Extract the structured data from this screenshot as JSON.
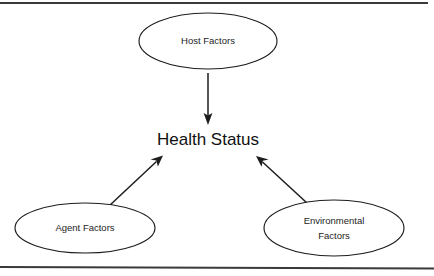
{
  "page": {
    "background_color": "#ffffff",
    "width": 434,
    "height": 276
  },
  "frame": {
    "line_color": "#3a3a3a",
    "top_rule_present": true,
    "bottom_rule_present": true
  },
  "diagram": {
    "type": "influence-diagram",
    "title": "",
    "center_node": {
      "id": "health-status",
      "label": "Health Status",
      "shape": "text-only",
      "text_color": "#111111",
      "cx": 208,
      "cy": 141
    },
    "nodes": [
      {
        "id": "host-factors",
        "label": "Host Factors",
        "lines": [
          "Host Factors"
        ],
        "shape": "ellipse",
        "cx": 208,
        "cy": 41,
        "rx": 69,
        "ry": 28,
        "fill": "#ffffff",
        "stroke": "#1d1d1d"
      },
      {
        "id": "agent-factors",
        "label": "Agent Factors",
        "lines": [
          "Agent Factors"
        ],
        "shape": "ellipse",
        "cx": 85,
        "cy": 228,
        "rx": 70,
        "ry": 25,
        "fill": "#ffffff",
        "stroke": "#1d1d1d"
      },
      {
        "id": "environmental-factors",
        "label": "Environmental Factors",
        "lines": [
          "Environmental",
          "Factors"
        ],
        "shape": "ellipse",
        "cx": 334,
        "cy": 228,
        "rx": 70,
        "ry": 28,
        "fill": "#ffffff",
        "stroke": "#1d1d1d"
      }
    ],
    "edges": [
      {
        "id": "host-to-health",
        "from": "host-factors",
        "to": "health-status",
        "direction": "down",
        "arrowhead": "at-target",
        "x1": 208,
        "y1": 73,
        "x2": 208,
        "y2": 124
      },
      {
        "id": "agent-to-health",
        "from": "agent-factors",
        "to": "health-status",
        "direction": "up-right",
        "arrowhead": "at-target",
        "x1": 109,
        "y1": 206,
        "x2": 162,
        "y2": 156
      },
      {
        "id": "environment-to-health",
        "from": "environmental-factors",
        "to": "health-status",
        "direction": "up-left",
        "arrowhead": "at-target",
        "x1": 307,
        "y1": 203,
        "x2": 257,
        "y2": 157
      }
    ]
  }
}
